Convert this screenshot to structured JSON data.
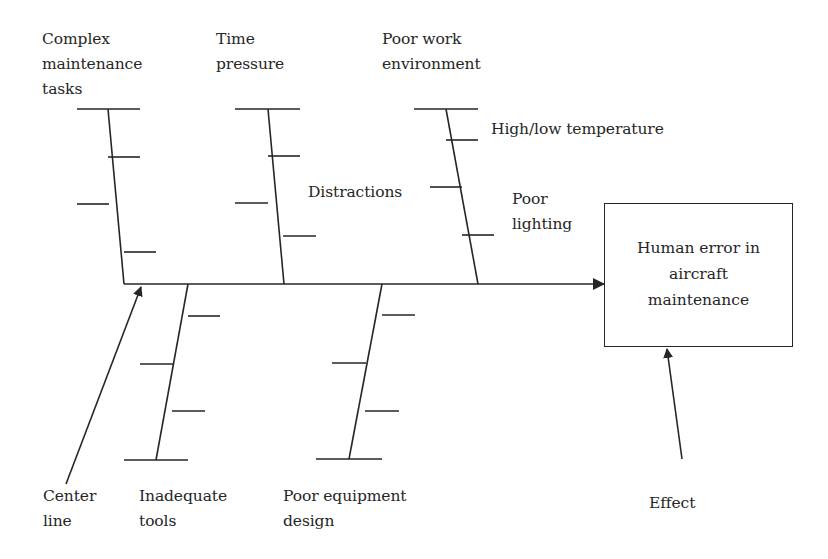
{
  "diagram": {
    "type": "fishbone (Ishikawa) cause-and-effect diagram",
    "effect": {
      "label": "Human error in\naircraft\nmaintenance",
      "annotation": "Effect"
    },
    "spine": {
      "annotation": "Center\nline"
    },
    "causes_top": [
      {
        "label": "Complex\nmaintenance\ntasks",
        "sub_causes": []
      },
      {
        "label": "Time\npressure",
        "sub_causes": []
      },
      {
        "label": "Poor work\nenvironment",
        "sub_causes": [
          "High/low temperature",
          "Distractions",
          "Poor\nlighting"
        ]
      }
    ],
    "causes_bottom": [
      {
        "label": "Inadequate\ntools",
        "sub_causes": []
      },
      {
        "label": "Poor equipment\ndesign",
        "sub_causes": []
      }
    ],
    "colors": {
      "line": "#262626",
      "text": "#262626",
      "background": "#ffffff"
    }
  }
}
